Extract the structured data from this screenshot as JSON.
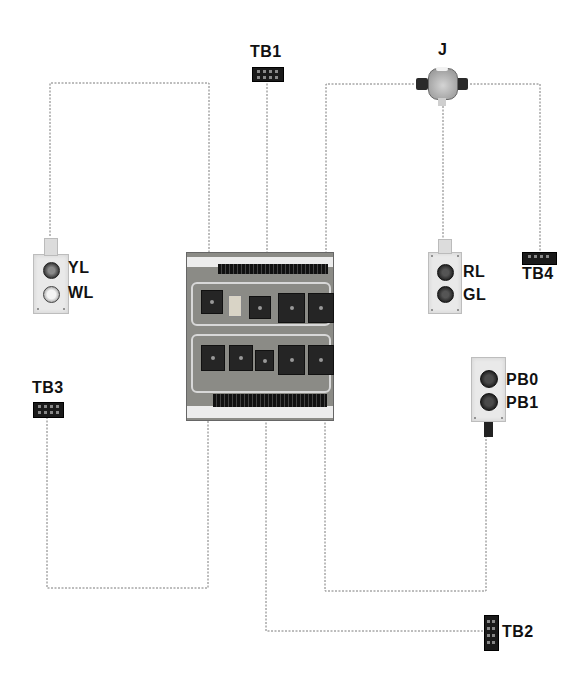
{
  "diagram": {
    "colors": {
      "background": "#ffffff",
      "wire": "#7a7a7a",
      "panel": "#8b8b86",
      "terminal_block": "#1a1a1a",
      "label": "#111111"
    },
    "components": {
      "tb1": {
        "label": "TB1",
        "type": "terminal-block"
      },
      "tb2": {
        "label": "TB2",
        "type": "terminal-block"
      },
      "tb3": {
        "label": "TB3",
        "type": "terminal-block"
      },
      "tb4": {
        "label": "TB4",
        "type": "terminal-block"
      },
      "junction": {
        "label": "J",
        "type": "junction-box"
      },
      "lamp_box_left": {
        "type": "pilot-lamp-box",
        "lamps": [
          {
            "label": "YL"
          },
          {
            "label": "WL"
          }
        ]
      },
      "lamp_box_right": {
        "type": "pilot-lamp-box",
        "lamps": [
          {
            "label": "RL"
          },
          {
            "label": "GL"
          }
        ]
      },
      "pushbutton_box": {
        "type": "pushbutton-box",
        "buttons": [
          {
            "label": "PB0"
          },
          {
            "label": "PB1"
          }
        ]
      },
      "relay_panel": {
        "type": "relay-panel",
        "relays_top_row": 5,
        "relays_bottom_row": 5
      }
    },
    "connections": [
      {
        "from": "lamp_box_left",
        "to": "relay_panel"
      },
      {
        "from": "tb1",
        "to": "relay_panel"
      },
      {
        "from": "junction",
        "to": "relay_panel"
      },
      {
        "from": "junction",
        "to": "lamp_box_right"
      },
      {
        "from": "junction",
        "to": "tb4"
      },
      {
        "from": "tb3",
        "to": "relay_panel"
      },
      {
        "from": "relay_panel",
        "to": "tb2"
      },
      {
        "from": "relay_panel",
        "to": "pushbutton_box"
      }
    ]
  }
}
